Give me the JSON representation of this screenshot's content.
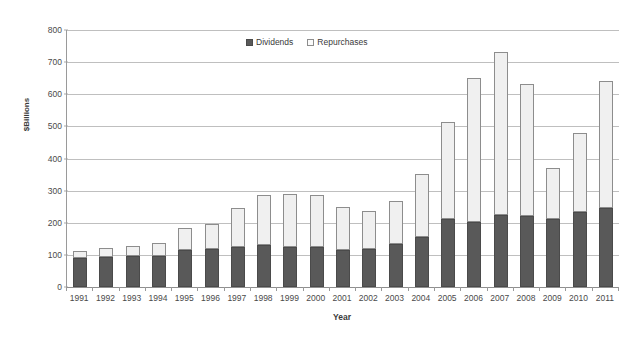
{
  "chart_data": {
    "type": "bar",
    "stacked": true,
    "title": "",
    "subtitle": "",
    "xlabel": "Year",
    "ylabel": "$Billions",
    "ylim": [
      0,
      800
    ],
    "ytick_values": [
      0,
      100,
      200,
      300,
      400,
      500,
      600,
      700,
      800
    ],
    "ytick_labels": [
      "0",
      "100",
      "200",
      "300",
      "400",
      "500",
      "600",
      "700",
      "800"
    ],
    "grid": "horizontal",
    "legend_position": "top-center",
    "categories": [
      "1991",
      "1992",
      "1993",
      "1994",
      "1995",
      "1996",
      "1997",
      "1998",
      "1999",
      "2000",
      "2001",
      "2002",
      "2003",
      "2004",
      "2005",
      "2006",
      "2007",
      "2008",
      "2009",
      "2010",
      "2011"
    ],
    "series": [
      {
        "name": "Dividends",
        "color": "#595959",
        "values": [
          90,
          92,
          96,
          98,
          116,
          118,
          124,
          130,
          125,
          126,
          116,
          119,
          133,
          157,
          213,
          202,
          224,
          221,
          213,
          232,
          247
        ]
      },
      {
        "name": "Repurchases",
        "color": "#f0f0f0",
        "values": [
          23,
          28,
          31,
          39,
          69,
          78,
          121,
          158,
          163,
          160,
          132,
          118,
          136,
          196,
          302,
          448,
          509,
          412,
          157,
          249,
          393
        ]
      }
    ],
    "totals": [
      113,
      120,
      127,
      137,
      185,
      196,
      245,
      288,
      288,
      286,
      248,
      237,
      269,
      353,
      515,
      650,
      733,
      633,
      370,
      481,
      640
    ]
  },
  "legend": {
    "items": [
      {
        "label": "Dividends",
        "swatch": "filled-square-icon"
      },
      {
        "label": "Repurchases",
        "swatch": "open-square-icon"
      }
    ]
  },
  "axes": {
    "y_title": "$Billions",
    "x_title": "Year"
  }
}
